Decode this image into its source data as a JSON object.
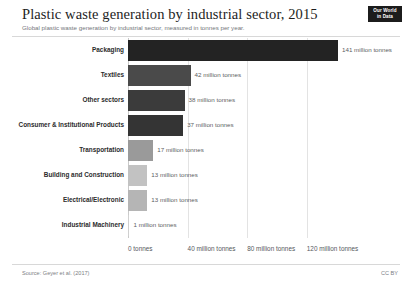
{
  "header": {
    "title": "Plastic waste generation by industrial sector, 2015",
    "subtitle": "Global plastic waste generation by industrial sector, measured in tonnes per year.",
    "logo_line1": "Our World",
    "logo_line2": "in Data"
  },
  "footer": {
    "source": "Source: Geyer et al. (2017)",
    "license": "CC BY"
  },
  "chart_data": {
    "type": "bar",
    "orientation": "horizontal",
    "title": "Plastic waste generation by industrial sector, 2015",
    "subtitle": "Global plastic waste generation by industrial sector, measured in tonnes per year.",
    "xlabel": "",
    "ylabel": "",
    "unit": "million tonnes",
    "xlim": [
      0,
      141
    ],
    "grid": true,
    "legend": "none",
    "categories": [
      "Packaging",
      "Textiles",
      "Other sectors",
      "Consumer & Institutional Products",
      "Transportation",
      "Building and Construction",
      "Electrical/Electronic",
      "Industrial Machinery"
    ],
    "values": [
      141,
      42,
      38,
      37,
      17,
      13,
      13,
      1
    ],
    "value_labels": [
      "141 million tonnes",
      "42 million tonnes",
      "38 million tonnes",
      "37 million tonnes",
      "17 million tonnes",
      "13 million tonnes",
      "13 million tonnes",
      "1 million tonnes"
    ],
    "bar_colors": [
      "#232323",
      "#4a4a4a",
      "#3b3b3b",
      "#343434",
      "#9a9a9a",
      "#c2c2c2",
      "#b5b5b5",
      "#d0d0d0"
    ],
    "xticks": [
      0,
      40,
      80,
      120
    ],
    "xtick_labels": [
      "0 tonnes",
      "40 million tonnes",
      "80 million tonnes",
      "120 million tonnes"
    ]
  }
}
